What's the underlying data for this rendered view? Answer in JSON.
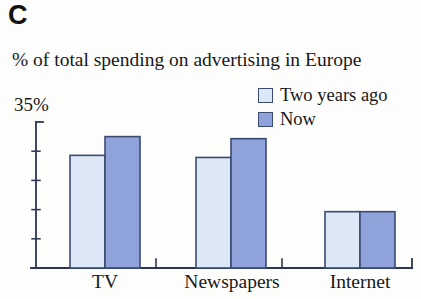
{
  "panel": {
    "label": "C"
  },
  "chart_data": {
    "type": "bar",
    "title": "% of total spending on advertising in Europe",
    "xlabel": "",
    "ylabel": "",
    "ylim": [
      0,
      35
    ],
    "y_top_tick_label": "35%",
    "grid": false,
    "legend_position": "top-right",
    "categories": [
      "TV",
      "Newspapers",
      "Internet"
    ],
    "series": [
      {
        "name": "Two years ago",
        "color": "#dce8f6",
        "values": [
          27,
          26.5,
          13.5
        ]
      },
      {
        "name": "Now",
        "color": "#8fa2da",
        "values": [
          31.5,
          31,
          13.5
        ]
      }
    ],
    "axis_color": "#2b3654",
    "bar_outline_color": "#3a4a72"
  }
}
